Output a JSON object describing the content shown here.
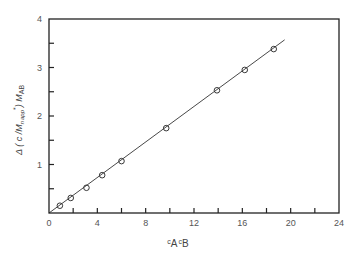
{
  "chart_data": {
    "type": "scatter",
    "title": "",
    "xlabel": "c_A c_B",
    "ylabel": "Δ(c/M_n app*)M_AB",
    "xlim": [
      0,
      24
    ],
    "ylim": [
      0,
      4
    ],
    "x_ticks": [
      0,
      4,
      8,
      12,
      16,
      20,
      24
    ],
    "y_ticks": [
      1,
      2,
      3,
      4
    ],
    "x_minor_ticks": [
      2,
      6,
      10,
      14,
      18,
      22
    ],
    "y_minor_ticks": [
      0.5,
      1.5,
      2.5,
      3.5
    ],
    "grid": false,
    "legend": null,
    "series": [
      {
        "name": "data",
        "marker": "open-circle",
        "x": [
          0.9,
          1.8,
          3.1,
          4.4,
          6.0,
          9.7,
          13.9,
          16.2,
          18.6
        ],
        "y": [
          0.15,
          0.31,
          0.52,
          0.78,
          1.07,
          1.75,
          2.53,
          2.95,
          3.38
        ]
      },
      {
        "name": "fit",
        "marker": "line",
        "x": [
          0,
          19.5
        ],
        "y": [
          0,
          3.57
        ]
      }
    ]
  },
  "labels": {
    "x_tick_0": "0",
    "x_tick_4": "4",
    "x_tick_8": "8",
    "x_tick_12": "12",
    "x_tick_16": "16",
    "x_tick_20": "20",
    "x_tick_24": "24",
    "y_tick_1": "1",
    "y_tick_2": "2",
    "y_tick_3": "3",
    "y_tick_4": "4",
    "ylabel_main": "Δ ( c /M",
    "ylabel_sub_n": "n",
    "ylabel_sub_app": "app",
    "ylabel_star": "*",
    "ylabel_close": ") M",
    "ylabel_sub_ab": "AB",
    "xlabel_c1": "c",
    "xlabel_sub_a": "A",
    "xlabel_c2": "c",
    "xlabel_sub_b": "B"
  }
}
